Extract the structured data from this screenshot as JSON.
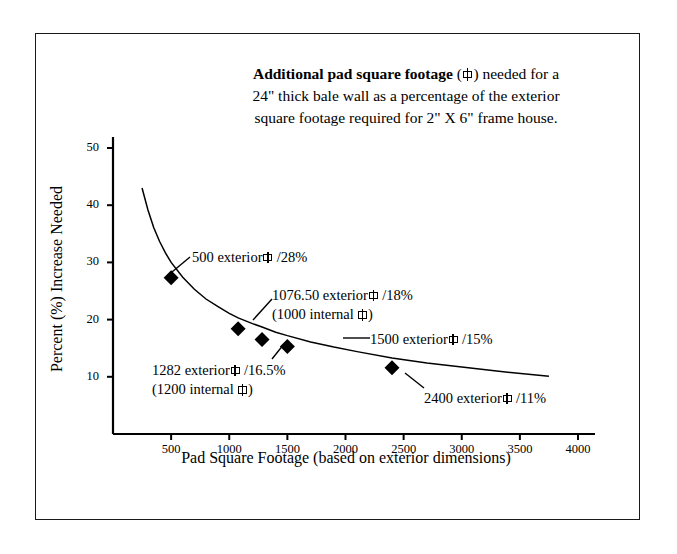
{
  "chart_data": {
    "type": "line",
    "title_parts": {
      "bold_lead": "Additional pad square footage",
      "after_glyph": ") needed for a",
      "line2": "24\" thick bale wall as a percentage of the exterior",
      "line3": "square footage required for 2\" X 6\" frame house."
    },
    "xlabel": "Pad Square Footage (based on exterior dimensions)",
    "ylabel": "Percent (%) Increase Needed",
    "xlim": [
      0,
      4000
    ],
    "ylim": [
      0,
      50
    ],
    "xticks": [
      500,
      1000,
      1500,
      2000,
      2500,
      3000,
      3500,
      4000
    ],
    "yticks": [
      10,
      20,
      30,
      40,
      50
    ],
    "grid": false,
    "legend": "none",
    "series": [
      {
        "name": "Percent increase needed",
        "marker": "filled-diamond",
        "line_color": "#000000",
        "x": [
          250,
          300,
          350,
          400,
          450,
          500,
          600,
          700,
          800,
          900,
          1000,
          1076.5,
          1200,
          1282,
          1400,
          1500,
          1700,
          1900,
          2100,
          2400,
          2700,
          3000,
          3300,
          3750
        ],
        "y": [
          43.0,
          39.2,
          36.1,
          33.7,
          31.7,
          30.0,
          27.4,
          25.3,
          23.6,
          22.3,
          21.1,
          20.3,
          19.3,
          18.7,
          17.8,
          17.2,
          16.1,
          15.2,
          14.4,
          13.3,
          12.4,
          11.7,
          11.0,
          10.1
        ]
      }
    ],
    "markers": [
      {
        "x": 500,
        "y": 27.3,
        "label": "500 exterior"
      },
      {
        "x": 1076.5,
        "y": 18.4,
        "label": "1076.50 exterior"
      },
      {
        "x": 1282,
        "y": 16.5,
        "label": "1282 exterior"
      },
      {
        "x": 1500,
        "y": 15.3,
        "label": "1500 exterior"
      },
      {
        "x": 2400,
        "y": 11.6,
        "label": "2400 exterior"
      }
    ],
    "annotations": [
      {
        "id": "ann-0",
        "line1_pre": "500 exterior",
        "line1_post": "/28%",
        "line2_pre": "",
        "line2_post": "",
        "target_x": 500,
        "target_y": 27.3
      },
      {
        "id": "ann-1",
        "line1_pre": "1076.50 exterior",
        "line1_post": "/18%",
        "line2_pre": "(1000 internal",
        "line2_post": ")",
        "target_x": 1076.5,
        "target_y": 18.4
      },
      {
        "id": "ann-2",
        "line1_pre": "1500 exterior",
        "line1_post": "/15%",
        "line2_pre": "",
        "line2_post": "",
        "target_x": 1500,
        "target_y": 15.3
      },
      {
        "id": "ann-3",
        "line1_pre": "1282 exterior",
        "line1_post": "/16.5%",
        "line2_pre": "(1200 internal",
        "line2_post": ")",
        "target_x": 1282,
        "target_y": 16.5
      },
      {
        "id": "ann-4",
        "line1_pre": "2400 exterior",
        "line1_post": "/11%",
        "line2_pre": "",
        "line2_post": "",
        "target_x": 2400,
        "target_y": 11.6
      }
    ],
    "axis_color": "#000000",
    "background": "#ffffff",
    "border_color": "#1a1a1a"
  }
}
